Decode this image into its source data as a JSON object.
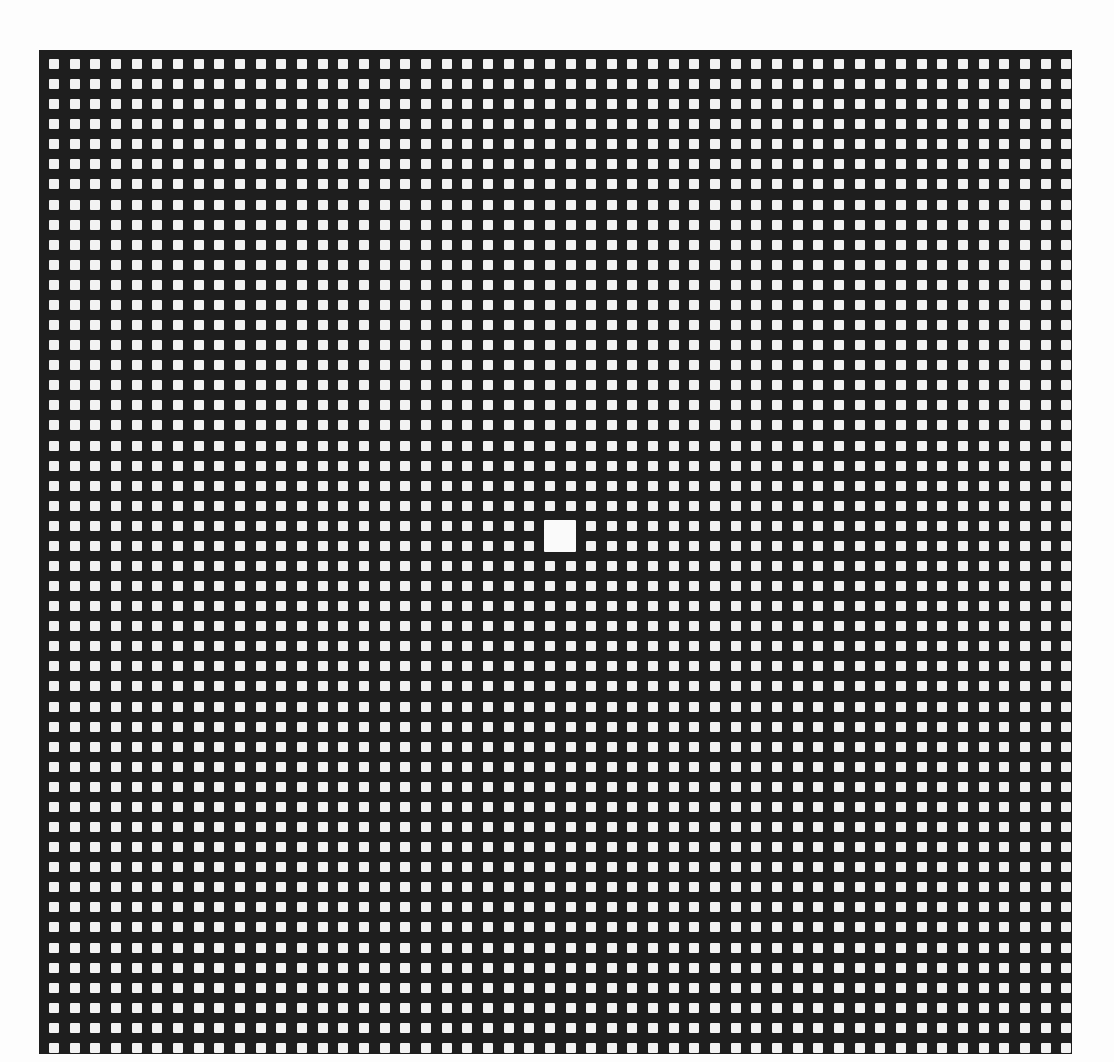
{
  "board": {
    "rows": 50,
    "cols": 50,
    "origin_x": 49,
    "origin_y": 59,
    "pitch_x": 20.66,
    "pitch_y": 20.08,
    "cell_size": 10,
    "background_color": "#1e1e1e",
    "cell_color": "#f2f2f2",
    "page_color": "#fdfdfd"
  },
  "highlighted_cell": {
    "row_start": 23,
    "col_start": 24,
    "row_span": 2,
    "col_span": 2,
    "color": "#fafafa"
  }
}
